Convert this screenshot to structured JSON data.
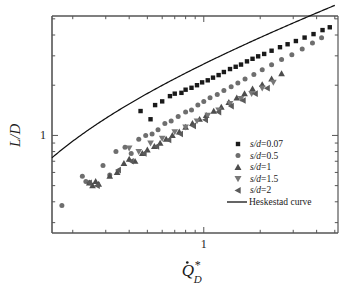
{
  "chart_data": {
    "type": "scatter",
    "title": "",
    "xlabel": "Q̇*D",
    "xlabel_parts": {
      "base": "Q",
      "dot": "·",
      "sup": "*",
      "sub": "D"
    },
    "ylabel": "L/D",
    "xscale": "log",
    "yscale": "log",
    "xlim": [
      0.155,
      5.2
    ],
    "ylim": [
      0.26,
      5.2
    ],
    "xticks_major": [
      1
    ],
    "xtick_labels": [
      "1"
    ],
    "yticks_major": [
      1
    ],
    "ytick_labels": [
      "1"
    ],
    "grid": false,
    "legend_position": "lower-right-inside",
    "series": [
      {
        "name": "s/d=0.07",
        "marker": "square",
        "color": "#1a1a1a",
        "points": [
          [
            0.46,
            1.4
          ],
          [
            0.52,
            1.25
          ],
          [
            0.55,
            1.52
          ],
          [
            0.6,
            1.6
          ],
          [
            0.66,
            1.72
          ],
          [
            0.7,
            1.78
          ],
          [
            0.76,
            1.8
          ],
          [
            0.8,
            1.88
          ],
          [
            0.86,
            1.93
          ],
          [
            0.92,
            2.0
          ],
          [
            0.98,
            2.08
          ],
          [
            1.05,
            2.14
          ],
          [
            1.12,
            2.22
          ],
          [
            1.2,
            2.3
          ],
          [
            1.28,
            2.4
          ],
          [
            1.38,
            2.5
          ],
          [
            1.48,
            2.58
          ],
          [
            1.58,
            2.66
          ],
          [
            1.7,
            2.78
          ],
          [
            1.82,
            2.88
          ],
          [
            1.95,
            2.98
          ],
          [
            2.1,
            3.08
          ],
          [
            2.3,
            3.22
          ],
          [
            2.55,
            3.38
          ],
          [
            2.8,
            3.52
          ],
          [
            3.1,
            3.68
          ],
          [
            3.45,
            3.86
          ],
          [
            3.85,
            4.05
          ],
          [
            4.3,
            4.28
          ],
          [
            4.7,
            4.45
          ]
        ]
      },
      {
        "name": "s/d=0.5",
        "marker": "circle",
        "color": "#6e6e6e",
        "points": [
          [
            0.175,
            0.38
          ],
          [
            0.225,
            0.57
          ],
          [
            0.235,
            0.53
          ],
          [
            0.245,
            0.52
          ],
          [
            0.29,
            0.66
          ],
          [
            0.315,
            0.58
          ],
          [
            0.34,
            0.8
          ],
          [
            0.38,
            0.85
          ],
          [
            0.41,
            0.78
          ],
          [
            0.45,
            0.95
          ],
          [
            0.49,
            1.0
          ],
          [
            0.53,
            1.02
          ],
          [
            0.57,
            1.08
          ],
          [
            0.62,
            1.18
          ],
          [
            0.67,
            1.22
          ],
          [
            0.73,
            1.3
          ],
          [
            0.8,
            1.38
          ],
          [
            0.86,
            1.42
          ],
          [
            0.93,
            1.52
          ],
          [
            1.0,
            1.6
          ],
          [
            1.08,
            1.68
          ],
          [
            1.18,
            1.76
          ],
          [
            1.28,
            1.86
          ],
          [
            1.4,
            1.96
          ],
          [
            1.52,
            2.06
          ],
          [
            1.66,
            2.18
          ],
          [
            1.85,
            2.32
          ],
          [
            2.05,
            2.48
          ],
          [
            2.3,
            2.65
          ],
          [
            2.6,
            2.85
          ],
          [
            2.95,
            3.05
          ],
          [
            3.35,
            3.3
          ],
          [
            3.8,
            3.58
          ],
          [
            4.25,
            3.85
          ]
        ]
      },
      {
        "name": "s/d=1",
        "marker": "triangle-up",
        "color": "#4d4d4d",
        "points": [
          [
            0.245,
            0.52
          ],
          [
            0.255,
            0.5
          ],
          [
            0.265,
            0.53
          ],
          [
            0.275,
            0.51
          ],
          [
            0.315,
            0.57
          ],
          [
            0.345,
            0.6
          ],
          [
            0.375,
            0.68
          ],
          [
            0.4,
            0.72
          ],
          [
            0.43,
            0.7
          ],
          [
            0.47,
            0.78
          ],
          [
            0.5,
            0.82
          ],
          [
            0.545,
            0.86
          ],
          [
            0.585,
            0.9
          ],
          [
            0.63,
            0.95
          ],
          [
            0.68,
            1.0
          ],
          [
            0.74,
            1.05
          ],
          [
            0.8,
            1.12
          ],
          [
            0.87,
            1.18
          ],
          [
            0.95,
            1.25
          ],
          [
            1.03,
            1.32
          ],
          [
            1.13,
            1.4
          ],
          [
            1.24,
            1.48
          ],
          [
            1.36,
            1.58
          ],
          [
            1.5,
            1.68
          ],
          [
            1.65,
            1.78
          ],
          [
            1.82,
            1.9
          ],
          [
            2.05,
            2.02
          ],
          [
            2.3,
            2.18
          ],
          [
            2.6,
            2.35
          ]
        ]
      },
      {
        "name": "s/d=1.5",
        "marker": "triangle-down",
        "color": "#777777",
        "points": [
          [
            0.4,
            0.84
          ],
          [
            0.45,
            0.8
          ],
          [
            0.52,
            0.9
          ],
          [
            0.6,
            0.96
          ],
          [
            0.7,
            1.05
          ],
          [
            0.8,
            1.12
          ],
          [
            0.92,
            1.22
          ],
          [
            1.05,
            1.32
          ],
          [
            1.2,
            1.42
          ],
          [
            1.38,
            1.55
          ],
          [
            1.58,
            1.66
          ],
          [
            1.8,
            1.78
          ],
          [
            2.05,
            1.92
          ],
          [
            2.35,
            2.08
          ]
        ]
      },
      {
        "name": "s/d=2",
        "marker": "triangle-left",
        "color": "#5a5a5a",
        "points": [
          [
            0.245,
            0.52
          ],
          [
            0.27,
            0.5
          ],
          [
            0.35,
            0.62
          ],
          [
            0.41,
            0.7
          ],
          [
            0.48,
            0.78
          ],
          [
            0.56,
            0.86
          ],
          [
            0.65,
            0.94
          ],
          [
            0.75,
            1.02
          ],
          [
            0.88,
            1.14
          ],
          [
            1.02,
            1.24
          ],
          [
            1.2,
            1.38
          ],
          [
            1.4,
            1.5
          ],
          [
            1.62,
            1.62
          ],
          [
            1.88,
            1.78
          ],
          [
            2.18,
            1.92
          ]
        ]
      }
    ],
    "curve": {
      "name": "Heskestad curve",
      "color": "#111111",
      "formula": "L/D = 3.7*Q^(2/5) - 1.02",
      "x_range": [
        0.155,
        5.0
      ]
    }
  },
  "legend": {
    "items": [
      {
        "label": "s/d=0.07",
        "marker": "square",
        "color": "#1a1a1a"
      },
      {
        "label": "s/d=0.5",
        "marker": "circle",
        "color": "#6e6e6e"
      },
      {
        "label": "s/d=1",
        "marker": "triangle-up",
        "color": "#4d4d4d"
      },
      {
        "label": "s/d=1.5",
        "marker": "triangle-down",
        "color": "#777777"
      },
      {
        "label": "s/d=2",
        "marker": "triangle-left",
        "color": "#5a5a5a"
      }
    ],
    "line_item": {
      "label": "Heskestad curve",
      "color": "#111111"
    }
  },
  "axes": {
    "y_title": "L/D",
    "y_tick_label": "1",
    "x_tick_label": "1"
  },
  "colors": {
    "frame": "#555555",
    "background": "#ffffff",
    "text": "#1a1a1a"
  }
}
